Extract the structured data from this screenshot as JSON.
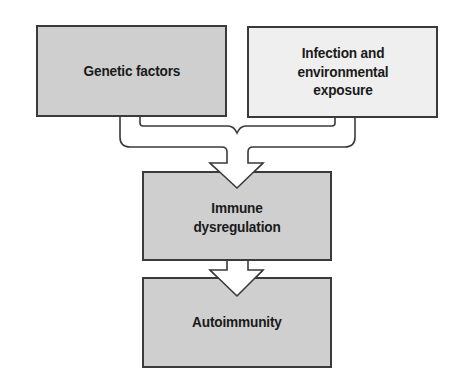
{
  "diagram": {
    "type": "flowchart",
    "nodes": [
      {
        "id": "genetic",
        "label": "Genetic factors",
        "fill": "#cfcfcf"
      },
      {
        "id": "infection",
        "label": "Infection and environmental exposure",
        "fill": "#efefef"
      },
      {
        "id": "immune",
        "label": "Immune dysregulation",
        "fill": "#cfcfcf"
      },
      {
        "id": "autoimmunity",
        "label": "Autoimmunity",
        "fill": "#cfcfcf"
      }
    ],
    "edges": [
      {
        "from": [
          "genetic",
          "infection"
        ],
        "to": "immune",
        "style": "merging hollow arrow"
      },
      {
        "from": "immune",
        "to": "autoimmunity",
        "style": "hollow arrow"
      }
    ],
    "colors": {
      "border": "#3a3a3a",
      "text": "#1a1a1a",
      "arrow_fill": "#ffffff"
    }
  }
}
